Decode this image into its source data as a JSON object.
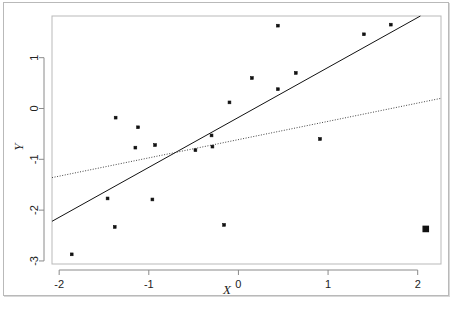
{
  "figure": {
    "type": "scatter-with-regression-lines",
    "background_color": "#ffffff",
    "frame_color": "#b9b9b9"
  },
  "chart_data": {
    "type": "scatter",
    "title": "",
    "subtitle": "",
    "xlabel": "X",
    "ylabel": "Y",
    "xlim": [
      -2.08,
      2.26
    ],
    "ylim": [
      -3.06,
      1.82
    ],
    "xticks": [
      -2,
      -1,
      0,
      1,
      2
    ],
    "xticklabels": [
      "-2",
      "-1",
      "0",
      "1",
      "2"
    ],
    "yticks": [
      1,
      0,
      -1,
      -2,
      -3
    ],
    "yticklabels": [
      "1",
      "0",
      "-1",
      "-2",
      "-3"
    ],
    "grid": false,
    "legend": "none",
    "point_color": "#111111",
    "points": [
      {
        "x": -1.86,
        "y": -2.87
      },
      {
        "x": -1.46,
        "y": -1.77
      },
      {
        "x": -1.38,
        "y": -2.33
      },
      {
        "x": -1.37,
        "y": -0.18
      },
      {
        "x": -1.15,
        "y": -0.77
      },
      {
        "x": -1.12,
        "y": -0.37
      },
      {
        "x": -0.96,
        "y": -1.79
      },
      {
        "x": -0.93,
        "y": -0.72
      },
      {
        "x": -0.48,
        "y": -0.82
      },
      {
        "x": -0.3,
        "y": -0.53
      },
      {
        "x": -0.29,
        "y": -0.75
      },
      {
        "x": -0.16,
        "y": -2.29
      },
      {
        "x": -0.1,
        "y": 0.12
      },
      {
        "x": 0.15,
        "y": 0.6
      },
      {
        "x": 0.44,
        "y": 1.63
      },
      {
        "x": 0.44,
        "y": 0.38
      },
      {
        "x": 0.64,
        "y": 0.7
      },
      {
        "x": 0.91,
        "y": -0.6
      },
      {
        "x": 1.4,
        "y": 1.46
      },
      {
        "x": 1.7,
        "y": 1.65
      }
    ],
    "highlighted_point": {
      "x": 2.09,
      "y": -2.37,
      "style": "bold-square-outlier"
    },
    "lines": [
      {
        "name": "solid-regression-line",
        "style": "solid",
        "color": "#111111",
        "x_start": -2.08,
        "y_start": -2.22,
        "x_end": 2.03,
        "y_end": 1.82
      },
      {
        "name": "dotted-regression-line",
        "style": "dotted",
        "color": "#444444",
        "x_start": -2.08,
        "y_start": -1.36,
        "x_end": 2.26,
        "y_end": 0.2
      }
    ]
  }
}
